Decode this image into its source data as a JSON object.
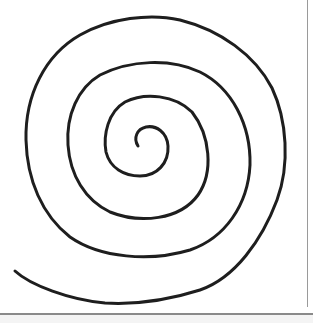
{
  "image": {
    "subject": "hand-drawn spiral",
    "stroke_color": "#1e1e1e",
    "background_color": "#ffffff",
    "border_color": "#8a8a8a",
    "turns": 4
  }
}
